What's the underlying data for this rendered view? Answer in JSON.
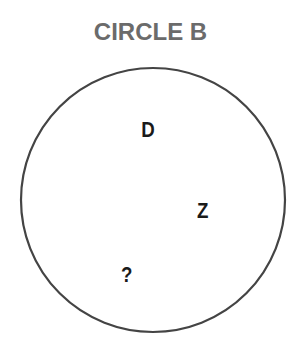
{
  "title": "CIRCLE B",
  "circle": {
    "cx": 153,
    "cy": 200,
    "r": 132,
    "stroke": "#444444"
  },
  "labels": [
    {
      "text": "D",
      "x": 140,
      "y": 117
    },
    {
      "text": "Z",
      "x": 196,
      "y": 198
    },
    {
      "text": "?",
      "x": 120,
      "y": 262
    }
  ]
}
